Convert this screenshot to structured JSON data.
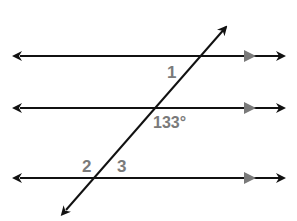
{
  "diagram": {
    "labels": {
      "angle1": "1",
      "angle_given": "133°",
      "angle2": "2",
      "angle3": "3"
    },
    "colors": {
      "line": "#111111",
      "parallel_marker": "#7a7a7a",
      "label": "#7a7a7a"
    }
  }
}
